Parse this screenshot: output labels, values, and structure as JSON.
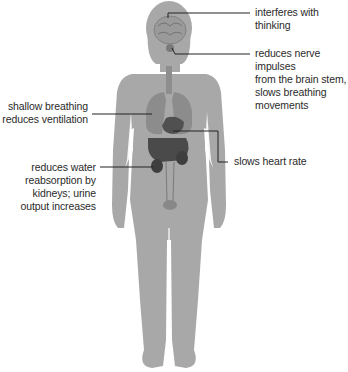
{
  "diagram": {
    "colors": {
      "body": "#a8a8a8",
      "organs": "#6e6e6e",
      "organs_dark": "#3e3e3e",
      "leader_line": "#222222",
      "text": "#2a2a2a"
    },
    "labels": [
      {
        "id": "brain",
        "text": "interferes with thinking",
        "side": "right",
        "target": "brain"
      },
      {
        "id": "brainstem",
        "text": "reduces nerve impulses\nfrom the brain stem,\nslows breathing\nmovements",
        "side": "right",
        "target": "brain stem"
      },
      {
        "id": "lungs",
        "text": "shallow breathing\nreduces ventilation",
        "side": "left",
        "target": "lungs"
      },
      {
        "id": "heart",
        "text": "slows heart rate",
        "side": "right",
        "target": "heart"
      },
      {
        "id": "kidneys",
        "text": "reduces water\nreabsorption by\nkidneys; urine\noutput increases",
        "side": "left",
        "target": "kidneys"
      }
    ]
  }
}
